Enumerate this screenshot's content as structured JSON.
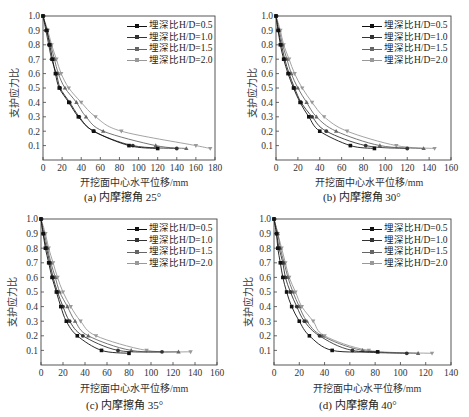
{
  "legend": [
    "埋深比H/D=0.5",
    "埋深比H/D=1.0",
    "埋深比H/D=1.5",
    "埋深比H/D=2.0"
  ],
  "series_colors": [
    "#111111",
    "#333333",
    "#666666",
    "#999999"
  ],
  "ylabel": "支护应力比",
  "xlabel": "开挖面中心水平位移/mm",
  "captions": [
    "(a) 内摩擦角 25°",
    "(b) 内摩擦角 30°",
    "(c) 内摩擦角 35°",
    "(d) 内摩擦角 40°"
  ],
  "chart_data": [
    {
      "type": "line",
      "title": "(a) 内摩擦角 25°",
      "xlabel": "开挖面中心水平位移/mm",
      "ylabel": "支护应力比",
      "xlim": [
        0,
        180
      ],
      "ylim": [
        0,
        1.0
      ],
      "xticks": [
        0,
        20,
        40,
        60,
        80,
        100,
        120,
        140,
        160,
        180
      ],
      "yticks": [
        0.1,
        0.2,
        0.3,
        0.4,
        0.5,
        0.6,
        0.7,
        0.8,
        0.9,
        1.0
      ],
      "legend_position": "upper right",
      "series": [
        {
          "name": "埋深比H/D=0.5",
          "x": [
            0,
            4,
            7,
            10,
            13,
            17,
            27,
            37,
            53,
            90,
            120
          ],
          "y": [
            1.0,
            0.9,
            0.8,
            0.7,
            0.6,
            0.5,
            0.4,
            0.3,
            0.2,
            0.1,
            0.08
          ]
        },
        {
          "name": "埋深比H/D=1.0",
          "x": [
            0,
            3,
            6,
            9,
            14,
            18,
            28,
            38,
            53,
            94,
            140
          ],
          "y": [
            1.0,
            0.9,
            0.8,
            0.7,
            0.6,
            0.5,
            0.4,
            0.3,
            0.2,
            0.1,
            0.08
          ]
        },
        {
          "name": "埋深比H/D=1.5",
          "x": [
            0,
            4,
            8,
            12,
            16,
            23,
            35,
            45,
            63,
            118,
            150
          ],
          "y": [
            1.0,
            0.9,
            0.8,
            0.7,
            0.6,
            0.5,
            0.4,
            0.3,
            0.2,
            0.1,
            0.08
          ]
        },
        {
          "name": "埋深比H/D=2.0",
          "x": [
            0,
            5,
            9,
            14,
            19,
            27,
            40,
            55,
            82,
            160,
            175
          ],
          "y": [
            1.0,
            0.9,
            0.8,
            0.7,
            0.6,
            0.5,
            0.4,
            0.3,
            0.2,
            0.1,
            0.08
          ]
        }
      ]
    },
    {
      "type": "line",
      "title": "(b) 内摩擦角 30°",
      "xlabel": "开挖面中心水平位移/mm",
      "ylabel": "支护应力比",
      "xlim": [
        0,
        160
      ],
      "ylim": [
        0,
        1.0
      ],
      "xticks": [
        0,
        20,
        40,
        60,
        80,
        100,
        120,
        140,
        160
      ],
      "yticks": [
        0.1,
        0.2,
        0.3,
        0.4,
        0.5,
        0.6,
        0.7,
        0.8,
        0.9,
        1.0
      ],
      "legend_position": "upper right",
      "series": [
        {
          "name": "埋深比H/D=0.5",
          "x": [
            0,
            2,
            4,
            7,
            11,
            16,
            22,
            30,
            40,
            68,
            90
          ],
          "y": [
            1.0,
            0.9,
            0.8,
            0.7,
            0.6,
            0.5,
            0.4,
            0.3,
            0.2,
            0.1,
            0.08
          ]
        },
        {
          "name": "埋深比H/D=1.0",
          "x": [
            0,
            2,
            5,
            8,
            12,
            17,
            23,
            33,
            46,
            82,
            120
          ],
          "y": [
            1.0,
            0.9,
            0.8,
            0.7,
            0.6,
            0.5,
            0.4,
            0.3,
            0.2,
            0.1,
            0.08
          ]
        },
        {
          "name": "埋深比H/D=1.5",
          "x": [
            0,
            3,
            6,
            10,
            14,
            20,
            28,
            37,
            55,
            95,
            135
          ],
          "y": [
            1.0,
            0.9,
            0.8,
            0.7,
            0.6,
            0.5,
            0.4,
            0.3,
            0.2,
            0.1,
            0.08
          ]
        },
        {
          "name": "埋深比H/D=2.0",
          "x": [
            0,
            4,
            7,
            12,
            17,
            24,
            33,
            44,
            65,
            110,
            145
          ],
          "y": [
            1.0,
            0.9,
            0.8,
            0.7,
            0.6,
            0.5,
            0.4,
            0.3,
            0.2,
            0.1,
            0.08
          ]
        }
      ]
    },
    {
      "type": "line",
      "title": "(c) 内摩擦角 35°",
      "xlabel": "开挖面中心水平位移/mm",
      "ylabel": "支护应力比",
      "xlim": [
        0,
        160
      ],
      "ylim": [
        0,
        1.0
      ],
      "xticks": [
        0,
        20,
        40,
        60,
        80,
        100,
        120,
        140,
        160
      ],
      "yticks": [
        0.1,
        0.2,
        0.3,
        0.4,
        0.5,
        0.6,
        0.7,
        0.8,
        0.9,
        1.0
      ],
      "legend_position": "upper right",
      "series": [
        {
          "name": "埋深比H/D=0.5",
          "x": [
            0,
            2,
            4,
            7,
            10,
            14,
            18,
            23,
            33,
            55,
            80
          ],
          "y": [
            1.0,
            0.9,
            0.8,
            0.7,
            0.6,
            0.5,
            0.4,
            0.3,
            0.2,
            0.1,
            0.08
          ]
        },
        {
          "name": "埋深比H/D=1.0",
          "x": [
            0,
            2,
            5,
            8,
            11,
            15,
            20,
            26,
            38,
            70,
            110
          ],
          "y": [
            1.0,
            0.9,
            0.8,
            0.7,
            0.6,
            0.5,
            0.4,
            0.3,
            0.2,
            0.1,
            0.09
          ]
        },
        {
          "name": "埋深比H/D=1.5",
          "x": [
            0,
            3,
            6,
            9,
            13,
            17,
            24,
            31,
            43,
            82,
            125
          ],
          "y": [
            1.0,
            0.9,
            0.8,
            0.7,
            0.6,
            0.5,
            0.4,
            0.3,
            0.2,
            0.1,
            0.09
          ]
        },
        {
          "name": "埋深比H/D=2.0",
          "x": [
            0,
            4,
            7,
            11,
            15,
            20,
            27,
            36,
            50,
            96,
            136
          ],
          "y": [
            1.0,
            0.9,
            0.8,
            0.7,
            0.6,
            0.5,
            0.4,
            0.3,
            0.2,
            0.1,
            0.09
          ]
        }
      ]
    },
    {
      "type": "line",
      "title": "(d) 内摩擦角 40°",
      "xlabel": "开挖面中心水平位移/mm",
      "ylabel": "支护应力比",
      "xlim": [
        0,
        140
      ],
      "ylim": [
        0,
        1.0
      ],
      "xticks": [
        0,
        20,
        40,
        60,
        80,
        100,
        120,
        140
      ],
      "yticks": [
        0.1,
        0.2,
        0.3,
        0.4,
        0.5,
        0.6,
        0.7,
        0.8,
        0.9,
        1.0
      ],
      "legend_position": "upper right",
      "series": [
        {
          "name": "埋深比H/D=0.5",
          "x": [
            0,
            2,
            3,
            5,
            7,
            10,
            14,
            20,
            28,
            46,
            82
          ],
          "y": [
            1.0,
            0.9,
            0.8,
            0.7,
            0.6,
            0.5,
            0.4,
            0.3,
            0.2,
            0.1,
            0.09
          ]
        },
        {
          "name": "埋深比H/D=1.0",
          "x": [
            0,
            2,
            4,
            7,
            9,
            13,
            18,
            24,
            36,
            62,
            105
          ],
          "y": [
            1.0,
            0.9,
            0.8,
            0.7,
            0.6,
            0.5,
            0.4,
            0.3,
            0.2,
            0.1,
            0.08
          ]
        },
        {
          "name": "埋深比H/D=1.5",
          "x": [
            0,
            3,
            5,
            8,
            11,
            15,
            20,
            26,
            38,
            70,
            114
          ],
          "y": [
            1.0,
            0.9,
            0.8,
            0.7,
            0.6,
            0.5,
            0.4,
            0.3,
            0.2,
            0.1,
            0.08
          ]
        },
        {
          "name": "埋深比H/D=2.0",
          "x": [
            0,
            3,
            6,
            9,
            12,
            17,
            22,
            31,
            40,
            75,
            125
          ],
          "y": [
            1.0,
            0.9,
            0.8,
            0.7,
            0.6,
            0.5,
            0.4,
            0.3,
            0.2,
            0.1,
            0.08
          ]
        }
      ]
    }
  ]
}
